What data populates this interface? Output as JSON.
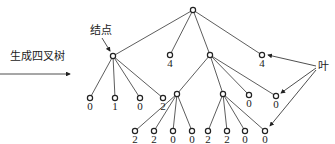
{
  "labels": {
    "generate_quadtree": "生成四叉树",
    "node": "结点",
    "leaf": "叶"
  },
  "tree": {
    "root": {
      "x": 193,
      "y": 10
    },
    "level1": [
      {
        "x": 113,
        "y": 56,
        "value": ""
      },
      {
        "x": 170,
        "y": 55,
        "value": "4"
      },
      {
        "x": 210,
        "y": 55,
        "value": ""
      },
      {
        "x": 262,
        "y": 55,
        "value": "4"
      }
    ],
    "a_children": [
      {
        "x": 90,
        "y": 98,
        "value": "0"
      },
      {
        "x": 115,
        "y": 98,
        "value": "1"
      },
      {
        "x": 140,
        "y": 98,
        "value": "0"
      },
      {
        "x": 163,
        "y": 98,
        "value": "2"
      }
    ],
    "c_children": [
      {
        "x": 177,
        "y": 94,
        "value": ""
      },
      {
        "x": 223,
        "y": 94,
        "value": ""
      },
      {
        "x": 249,
        "y": 95,
        "value": "0"
      },
      {
        "x": 276,
        "y": 96,
        "value": "0"
      }
    ],
    "c1_children": [
      {
        "x": 135,
        "y": 131,
        "value": "2"
      },
      {
        "x": 154,
        "y": 131,
        "value": "2"
      },
      {
        "x": 173,
        "y": 131,
        "value": "0"
      },
      {
        "x": 192,
        "y": 131,
        "value": "0"
      }
    ],
    "c2_children": [
      {
        "x": 208,
        "y": 131,
        "value": "2"
      },
      {
        "x": 227,
        "y": 131,
        "value": "2"
      },
      {
        "x": 245,
        "y": 131,
        "value": "0"
      },
      {
        "x": 265,
        "y": 131,
        "value": "0"
      }
    ]
  }
}
